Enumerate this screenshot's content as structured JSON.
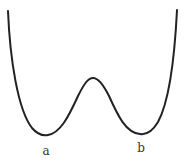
{
  "diagram": {
    "type": "double-well potential curve",
    "curve_color": "#222222",
    "points": {
      "left_top": [
        8,
        11
      ],
      "left_min": [
        47,
        135
      ],
      "peak": [
        93,
        78
      ],
      "right_min": [
        140,
        134
      ],
      "right_top": [
        177,
        10
      ]
    },
    "labels": {
      "left_min": "a",
      "right_min": "b"
    }
  }
}
